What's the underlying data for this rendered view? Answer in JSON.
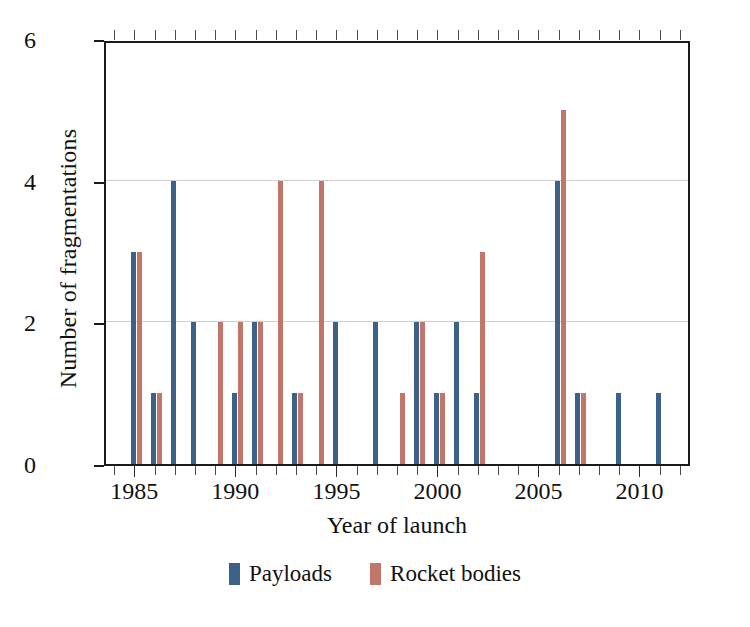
{
  "chart_data": {
    "type": "bar",
    "title": "",
    "xlabel": "Year of launch",
    "ylabel": "Number of fragmentations",
    "xlim": [
      1983.5,
      2012.5
    ],
    "ylim": [
      0,
      6
    ],
    "yticks": [
      0,
      2,
      4,
      6
    ],
    "xticks": [
      1985,
      1990,
      1995,
      2000,
      2005,
      2010
    ],
    "xtick_labels": [
      "1985",
      "1990",
      "1995",
      "2000",
      "2005",
      "2010"
    ],
    "ytick_labels": [
      "0",
      "2",
      "4",
      "6"
    ],
    "grid": "horizontal",
    "legend_position": "bottom-center",
    "colors": {
      "payloads": "#3d6289",
      "rocket_bodies": "#c1766c",
      "axis": "#1a1a1a",
      "gridline": "#cfcfcf",
      "background": "#ffffff"
    },
    "categories": [
      1984,
      1985,
      1986,
      1987,
      1988,
      1989,
      1990,
      1991,
      1992,
      1993,
      1994,
      1995,
      1996,
      1997,
      1998,
      1999,
      2000,
      2001,
      2002,
      2003,
      2004,
      2005,
      2006,
      2007,
      2008,
      2009,
      2010,
      2011,
      2012
    ],
    "series": [
      {
        "name": "Payloads",
        "color": "#3d6289",
        "values": [
          0,
          3,
          1,
          4,
          2,
          0,
          1,
          2,
          0,
          1,
          0,
          2,
          0,
          2,
          0,
          2,
          1,
          2,
          1,
          0,
          0,
          0,
          4,
          1,
          0,
          1,
          0,
          1,
          0
        ]
      },
      {
        "name": "Rocket bodies",
        "color": "#c1766c",
        "values": [
          0,
          3,
          1,
          0,
          0,
          2,
          2,
          2,
          4,
          1,
          4,
          0,
          0,
          0,
          1,
          2,
          1,
          0,
          3,
          0,
          0,
          0,
          5,
          1,
          0,
          0,
          0,
          0,
          0
        ]
      }
    ]
  },
  "legend": {
    "items": [
      {
        "label": "Payloads",
        "swatch": "payload"
      },
      {
        "label": "Rocket bodies",
        "swatch": "rocket"
      }
    ]
  }
}
